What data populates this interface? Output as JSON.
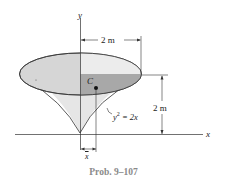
{
  "figure": {
    "caption": "Prob. 9–107",
    "axes": {
      "x_label": "x",
      "y_label": "y"
    },
    "dimensions": {
      "radius": "2 m",
      "height": "2 m"
    },
    "curve_equation": {
      "lhs": "y",
      "exp": "2",
      "rhs": " = 2x"
    },
    "centroid_label": "C",
    "centroid_offset_label": "x",
    "colors": {
      "top_ellipse": "#d6d6d6",
      "shaded_quadrant": "#a8a8a8",
      "cone_surface": "#e4e4e4",
      "outline": "#333333",
      "caption": "#8a8a8a"
    }
  }
}
